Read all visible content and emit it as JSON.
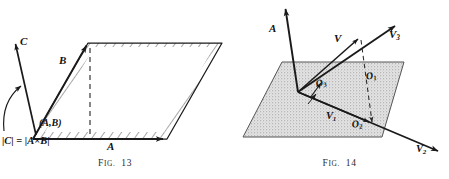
{
  "plate": {
    "background_color": "#ffffff",
    "ink_color": "#1a1a1a",
    "plane_fill_color": "#d2d2d2",
    "figure_count": 2
  },
  "figures": [
    {
      "id": "fig13",
      "caption_prefix": "F",
      "caption_smallcaps": "IG.",
      "caption_number": "13",
      "caption": "Fig. 13",
      "subject": "cross-product parallelogram with normal vector C",
      "labels": {
        "vector_a": "A",
        "vector_b": "B",
        "vector_c": "C",
        "angle": "(A,B)",
        "magnitude_open": "|",
        "magnitude_c": "C",
        "magnitude_eq": "| = |",
        "magnitude_a": "A",
        "cross_symbol": "×",
        "magnitude_b": "B",
        "magnitude_close": "|",
        "magnitude_formula": "|C| = |A×B|"
      }
    },
    {
      "id": "fig14",
      "caption_prefix": "F",
      "caption_smallcaps": "IG.",
      "caption_number": "14",
      "caption": "Fig. 14",
      "subject": "vector V and its components V1 V2 V3 relative to plane with normal A",
      "labels": {
        "vector_a": "A",
        "vector_v": "V",
        "vector_v1": "V",
        "vector_v1_sub": "1",
        "vector_v2": "V",
        "vector_v2_sub": "2",
        "vector_v3": "V",
        "vector_v3_sub": "3",
        "origin_o1": "O",
        "origin_o1_sub": "1",
        "origin_o2": "O",
        "origin_o2_sub": "2",
        "origin_o3": "O",
        "origin_o3_sub": "3"
      }
    }
  ]
}
